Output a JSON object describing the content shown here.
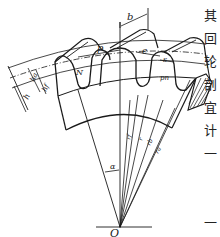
{
  "diagram": {
    "type": "spur-gear-tooth-nomenclature",
    "labels": {
      "face_width": "b",
      "circular_pitch": "p",
      "space_width": "e",
      "tooth_thickness": "s",
      "whole_depth": "h",
      "addendum": "hₐ",
      "dedendum": "h_f",
      "normal_pitch": "N",
      "base_pitch": "pₙ",
      "pressure_angle": "α",
      "center": "O",
      "root_radius": "r_f",
      "pitch_radius": "r",
      "base_radius": "r_b",
      "addendum_radius": "rₐ"
    },
    "label_text": {
      "b": "b",
      "p": "p",
      "e": "e",
      "s": "s",
      "h": "h",
      "ha": "ha",
      "hf": "hf",
      "N": "N",
      "pn": "pn",
      "alpha": "α",
      "O": "O",
      "rf": "rf",
      "r": "r",
      "rb": "rb",
      "ra": "ra"
    },
    "colors": {
      "line": "#1a1a1a",
      "background": "#ffffff"
    }
  },
  "side_text": {
    "chars": [
      "其",
      "回",
      "轮",
      "剖",
      "宜",
      "计",
      "一",
      "",
      "",
      "一",
      "回"
    ]
  }
}
